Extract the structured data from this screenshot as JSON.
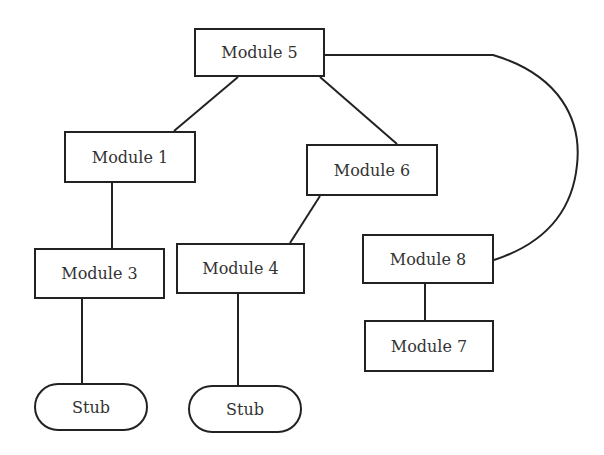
{
  "diagram": {
    "title": "",
    "stroke_color": "#222222",
    "text_color": "#333333",
    "nodes": [
      {
        "id": "m5",
        "label": "Module 5",
        "shape": "rect",
        "x": 194,
        "y": 28,
        "w": 131,
        "h": 49
      },
      {
        "id": "m1",
        "label": "Module 1",
        "shape": "rect",
        "x": 64,
        "y": 131,
        "w": 132,
        "h": 52
      },
      {
        "id": "m6",
        "label": "Module 6",
        "shape": "rect",
        "x": 306,
        "y": 144,
        "w": 132,
        "h": 52
      },
      {
        "id": "m3",
        "label": "Module 3",
        "shape": "rect",
        "x": 34,
        "y": 248,
        "w": 131,
        "h": 51
      },
      {
        "id": "m4",
        "label": "Module 4",
        "shape": "rect",
        "x": 176,
        "y": 243,
        "w": 129,
        "h": 51
      },
      {
        "id": "m8",
        "label": "Module 8",
        "shape": "rect",
        "x": 362,
        "y": 234,
        "w": 132,
        "h": 50
      },
      {
        "id": "m7",
        "label": "Module 7",
        "shape": "rect",
        "x": 364,
        "y": 320,
        "w": 130,
        "h": 52
      },
      {
        "id": "stub1",
        "label": "Stub",
        "shape": "rounded",
        "x": 34,
        "y": 383,
        "w": 114,
        "h": 48
      },
      {
        "id": "stub2",
        "label": "Stub",
        "shape": "rounded",
        "x": 188,
        "y": 385,
        "w": 114,
        "h": 48
      }
    ],
    "edges": [
      {
        "from": "m5",
        "to": "m1",
        "type": "line"
      },
      {
        "from": "m5",
        "to": "m6",
        "type": "line"
      },
      {
        "from": "m5",
        "to": "m8",
        "type": "curve"
      },
      {
        "from": "m1",
        "to": "m3",
        "type": "line"
      },
      {
        "from": "m6",
        "to": "m4",
        "type": "line"
      },
      {
        "from": "m3",
        "to": "stub1",
        "type": "line"
      },
      {
        "from": "m4",
        "to": "stub2",
        "type": "line"
      },
      {
        "from": "m8",
        "to": "m7",
        "type": "line"
      }
    ]
  }
}
